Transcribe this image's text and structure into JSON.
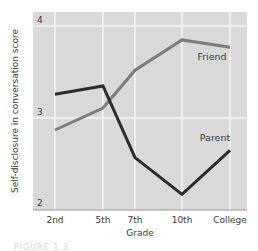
{
  "chart_data": {
    "type": "line",
    "title": "",
    "xlabel": "Grade",
    "ylabel": "Self-disclosure in conversation score",
    "categories": [
      "2nd",
      "5th",
      "7th",
      "10th",
      "College"
    ],
    "ylim": [
      2,
      4
    ],
    "yticks": [
      "2",
      "3",
      "4"
    ],
    "grid": true,
    "legend": "inline labels",
    "series": [
      {
        "name": "Parent",
        "color": "#2b2b2b",
        "values": [
          3.27,
          3.36,
          2.58,
          2.18,
          2.66
        ]
      },
      {
        "name": "Friend",
        "color": "#7d7d7d",
        "values": [
          2.88,
          3.12,
          3.53,
          3.86,
          3.78
        ]
      }
    ],
    "annotations": [
      {
        "text": "Friend",
        "near": "College"
      },
      {
        "text": "Parent",
        "near": "College"
      }
    ]
  },
  "caption": "FIGURE 1.3"
}
